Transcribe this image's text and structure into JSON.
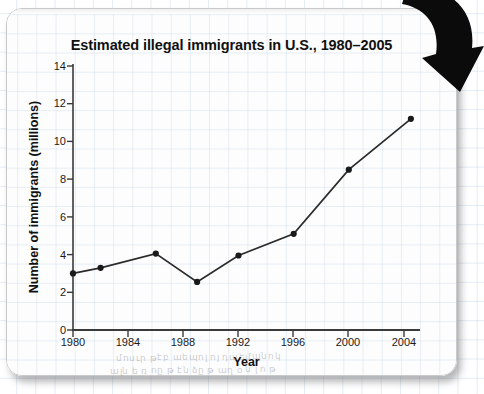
{
  "chart_data": {
    "type": "line",
    "title": "Estimated illegal immigrants in U.S., 1980–2005",
    "xlabel": "Year",
    "ylabel": "Number of immigrants (millions)",
    "xlim": [
      1980,
      2006.3
    ],
    "ylim": [
      0,
      14
    ],
    "grid": false,
    "legend": "none",
    "x_ticks": [
      1980,
      1984,
      1988,
      1992,
      1996,
      2000,
      2004
    ],
    "y_ticks": [
      0,
      2,
      4,
      6,
      8,
      10,
      12,
      14
    ],
    "series": [
      {
        "name": "Estimated illegal immigrants",
        "marker": "filled-circle",
        "color": "#1a1a1a",
        "x": [
          1980,
          1982,
          1986,
          1989,
          1992,
          1996,
          2000,
          2004.5
        ],
        "values": [
          3.0,
          3.3,
          4.05,
          2.55,
          3.95,
          5.1,
          8.5,
          11.2
        ]
      }
    ],
    "points": [
      {
        "year": 1980,
        "value": 3.0
      },
      {
        "year": 1982,
        "value": 3.3
      },
      {
        "year": 1986,
        "value": 4.05
      },
      {
        "year": 1989,
        "value": 2.55
      },
      {
        "year": 1992,
        "value": 3.95
      },
      {
        "year": 1996,
        "value": 5.1
      },
      {
        "year": 2000,
        "value": 8.5
      },
      {
        "year": 2004.5,
        "value": 11.2
      }
    ]
  },
  "annotations": {
    "arrow": "down-right-curved-arrow",
    "pencil_line_1": "մոսւր թէբ աեպոլ ոյ դաեմպնոկ",
    "pencil_line_2": "ալն ե ռ ոը թ էն ձը թ աղ օ ն լ ո թ"
  }
}
